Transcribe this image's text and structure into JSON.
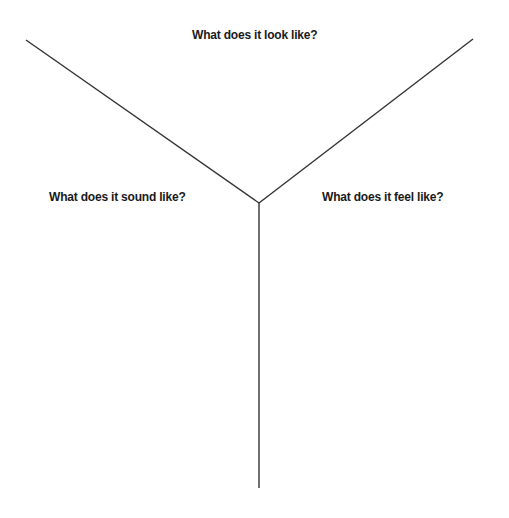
{
  "diagram": {
    "type": "y-chart",
    "labels": {
      "top": "What does it look like?",
      "left": "What does it sound like?",
      "right": "What does it feel like?"
    },
    "line_color": "#333333",
    "geometry": {
      "center": [
        259,
        203
      ],
      "left_arm_end": [
        26,
        40
      ],
      "right_arm_end": [
        473,
        39
      ],
      "stem_end": [
        259,
        488
      ]
    }
  }
}
